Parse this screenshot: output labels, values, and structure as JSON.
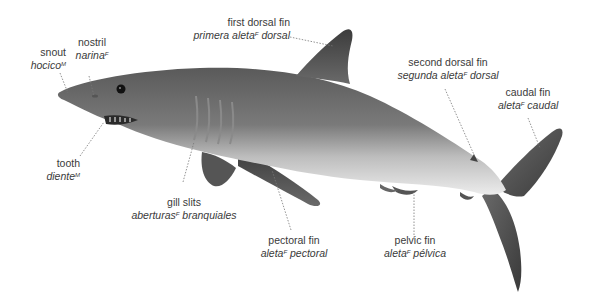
{
  "diagram": {
    "labels": [
      {
        "id": "snout",
        "en": "snout",
        "es": "hocico",
        "gender": "M"
      },
      {
        "id": "nostril",
        "en": "nostril",
        "es": "narina",
        "gender": "F"
      },
      {
        "id": "first-dorsal-fin",
        "en": "first dorsal fin",
        "es_pre": "primera aleta",
        "gender": "F",
        "es_post": " dorsal"
      },
      {
        "id": "second-dorsal-fin",
        "en": "second dorsal fin",
        "es_pre": "segunda aleta",
        "gender": "F",
        "es_post": " dorsal"
      },
      {
        "id": "caudal-fin",
        "en": "caudal fin",
        "es_pre": "aleta",
        "gender": "F",
        "es_post": " caudal"
      },
      {
        "id": "tooth",
        "en": "tooth",
        "es": "diente",
        "gender": "M"
      },
      {
        "id": "gill-slits",
        "en": "gill slits",
        "es_pre": "aberturas",
        "gender": "F",
        "es_post": " branquiales"
      },
      {
        "id": "pectoral-fin",
        "en": "pectoral fin",
        "es_pre": "aleta",
        "gender": "F",
        "es_post": " pectoral"
      },
      {
        "id": "pelvic-fin",
        "en": "pelvic fin",
        "es_pre": "aleta",
        "gender": "F",
        "es_post": " pélvica"
      }
    ],
    "colors": {
      "text": "#3a3a3a",
      "leader": "#777777",
      "body_dark": "#4a4a4a",
      "body_light": "#e6e6e6"
    }
  }
}
